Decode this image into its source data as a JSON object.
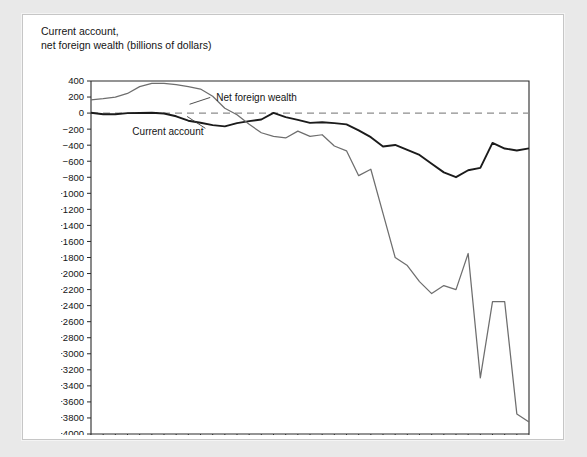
{
  "figure": {
    "title_line1": "Current account,",
    "title_line2": "net foreign wealth (billions of dollars)"
  },
  "annotations": {
    "net_foreign_wealth_label": "Net foreign wealth",
    "current_account_label": "Current account"
  },
  "chart_data": {
    "type": "line",
    "title": "Current account, net foreign wealth (billions of dollars)",
    "xlabel": "",
    "ylabel": "billions of dollars",
    "xlim": [
      1976,
      2012
    ],
    "ylim": [
      -4000,
      400
    ],
    "ytick_step": 200,
    "xtick_step": 2,
    "grid": false,
    "legend": "inline-annotations",
    "zero_reference_line": true,
    "yticks": [
      400,
      200,
      0,
      -200,
      -400,
      -600,
      -800,
      -1000,
      -1200,
      -1400,
      -1600,
      -1800,
      -2000,
      -2200,
      -2400,
      -2600,
      -2800,
      -3000,
      -3200,
      -3400,
      -3600,
      -3800,
      -4000
    ],
    "xticks": [
      1976,
      1978,
      1980,
      1982,
      1984,
      1986,
      1988,
      1990,
      1992,
      1994,
      1996,
      1998,
      2000,
      2002,
      2004,
      2006,
      2008,
      2010,
      2012
    ],
    "x": [
      1976,
      1977,
      1978,
      1979,
      1980,
      1981,
      1982,
      1983,
      1984,
      1985,
      1986,
      1987,
      1988,
      1989,
      1990,
      1991,
      1992,
      1993,
      1994,
      1995,
      1996,
      1997,
      1998,
      1999,
      2000,
      2001,
      2002,
      2003,
      2004,
      2005,
      2006,
      2007,
      2008,
      2009,
      2010,
      2011,
      2012
    ],
    "series": [
      {
        "name": "Current account",
        "color": "#1b1b1b",
        "width": 1.9,
        "values": [
          5,
          -15,
          -15,
          -1,
          2,
          5,
          -5,
          -40,
          -95,
          -120,
          -150,
          -165,
          -125,
          -100,
          -80,
          3,
          -50,
          -85,
          -122,
          -114,
          -125,
          -141,
          -215,
          -300,
          -417,
          -397,
          -459,
          -522,
          -631,
          -739,
          -799,
          -713,
          -682,
          -372,
          -442,
          -466,
          -440
        ]
      },
      {
        "name": "Net foreign wealth",
        "color": "#6e6e6e",
        "width": 1.25,
        "values": [
          165,
          180,
          200,
          245,
          330,
          370,
          370,
          355,
          330,
          300,
          210,
          60,
          -20,
          -140,
          -245,
          -290,
          -310,
          -225,
          -290,
          -270,
          -410,
          -470,
          -780,
          -700,
          -1250,
          -1800,
          -1900,
          -2100,
          -2250,
          -2150,
          -2200,
          -1750,
          -3300,
          -2350,
          -2350,
          -3750,
          -3850
        ]
      }
    ]
  }
}
